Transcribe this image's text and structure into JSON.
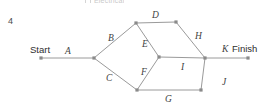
{
  "page": {
    "question_number": "4",
    "cropped_legend_text": "Electrical"
  },
  "diagram": {
    "type": "activity-on-arrow-network",
    "start_label": "Start",
    "finish_label": "Finish",
    "nodes": [
      {
        "id": "start",
        "name": "start-node",
        "x": 41,
        "y": 58
      },
      {
        "id": "n1",
        "name": "junction-node-1",
        "x": 94,
        "y": 58
      },
      {
        "id": "n2",
        "name": "upper-node-left",
        "x": 136,
        "y": 23
      },
      {
        "id": "n3",
        "name": "upper-node-right",
        "x": 176,
        "y": 22
      },
      {
        "id": "n4",
        "name": "center-node",
        "x": 159,
        "y": 57
      },
      {
        "id": "n5",
        "name": "lower-node-left",
        "x": 137,
        "y": 90
      },
      {
        "id": "n6",
        "name": "lower-node-right",
        "x": 201,
        "y": 90
      },
      {
        "id": "n7",
        "name": "merge-node",
        "x": 205,
        "y": 58
      },
      {
        "id": "finish",
        "name": "finish-node",
        "x": 248,
        "y": 58
      }
    ],
    "edges": [
      {
        "id": "A",
        "label": "A",
        "from": "start",
        "to": "n1",
        "label_x": 65,
        "label_y": 47
      },
      {
        "id": "B",
        "label": "B",
        "from": "n1",
        "to": "n2",
        "label_x": 108,
        "label_y": 34
      },
      {
        "id": "C",
        "label": "C",
        "from": "n1",
        "to": "n5",
        "label_x": 106,
        "label_y": 74
      },
      {
        "id": "D",
        "label": "D",
        "from": "n2",
        "to": "n3",
        "label_x": 152,
        "label_y": 11
      },
      {
        "id": "E",
        "label": "E",
        "from": "n2",
        "to": "n4",
        "label_x": 142,
        "label_y": 40
      },
      {
        "id": "F",
        "label": "F",
        "from": "n5",
        "to": "n4",
        "label_x": 141,
        "label_y": 68
      },
      {
        "id": "G",
        "label": "G",
        "from": "n5",
        "to": "n6",
        "label_x": 165,
        "label_y": 95
      },
      {
        "id": "H",
        "label": "H",
        "from": "n3",
        "to": "n7",
        "label_x": 195,
        "label_y": 32
      },
      {
        "id": "I",
        "label": "I",
        "from": "n4",
        "to": "n7",
        "label_x": 181,
        "label_y": 63
      },
      {
        "id": "J",
        "label": "J",
        "from": "n6",
        "to": "n7",
        "label_x": 222,
        "label_y": 78
      },
      {
        "id": "K",
        "label": "K",
        "from": "n7",
        "to": "finish",
        "label_x": 222,
        "label_y": 45
      }
    ],
    "terminals": [
      {
        "id": "start-text",
        "name": "start-label",
        "text": "Start",
        "x": 30,
        "y": 45
      },
      {
        "id": "finish-text",
        "name": "finish-label",
        "text": "Finish",
        "x": 232,
        "y": 44
      }
    ],
    "colors": {
      "edge": "#9a9a9a",
      "node": "#8a8a8a",
      "label_text": "#3f3f3f",
      "terminal_text": "#2e2e2e",
      "background": "#ffffff"
    }
  }
}
